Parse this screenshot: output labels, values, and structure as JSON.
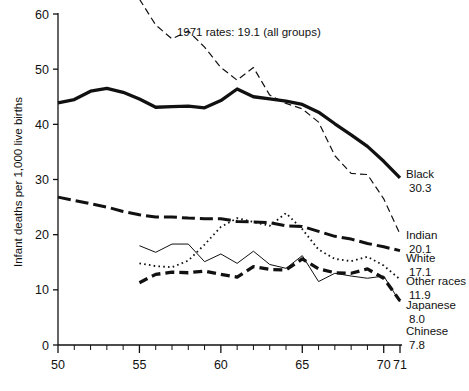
{
  "chart_data": {
    "type": "line",
    "title": "",
    "xlabel": "",
    "ylabel": "Infant deaths per 1,000 live births",
    "xlim": [
      50,
      71
    ],
    "ylim": [
      0,
      60
    ],
    "grid": false,
    "legend_position": "right-end-labels",
    "x_ticks_major": [
      "50",
      "55",
      "60",
      "65",
      "70",
      "71"
    ],
    "x_ticks_major_values": [
      50,
      55,
      60,
      65,
      70,
      71
    ],
    "x_ticks_minor_values": [
      51,
      52,
      53,
      54,
      56,
      57,
      58,
      59,
      61,
      62,
      63,
      64,
      66,
      67,
      68,
      69
    ],
    "y_ticks": [
      "0",
      "10",
      "20",
      "30",
      "40",
      "50",
      "60"
    ],
    "y_ticks_values": [
      0,
      10,
      20,
      30,
      40,
      50,
      60
    ],
    "annotations": [
      {
        "text": "1971 rates: 19.1 (all groups)",
        "x": 57.3,
        "y": 56.0
      }
    ],
    "series": [
      {
        "name": "Black",
        "style": "solid-thick",
        "end_label": "Black",
        "end_value": "30.3",
        "x": [
          50,
          51,
          52,
          53,
          54,
          55,
          56,
          57,
          58,
          59,
          60,
          61,
          62,
          63,
          64,
          65,
          66,
          67,
          68,
          69,
          70,
          71
        ],
        "values": [
          43.9,
          44.5,
          46.0,
          46.5,
          45.8,
          44.6,
          43.1,
          43.2,
          43.3,
          43.0,
          44.3,
          46.4,
          45.0,
          44.6,
          44.2,
          43.6,
          42.2,
          40.1,
          38.1,
          36.0,
          33.3,
          30.3
        ]
      },
      {
        "name": "Indian",
        "style": "dashed-thin",
        "end_label": "Indian",
        "end_value": "20.1",
        "x": [
          55,
          56,
          57,
          58,
          59,
          60,
          61,
          62,
          63,
          64,
          65,
          66,
          67,
          68,
          69,
          70,
          71
        ],
        "values": [
          62.7,
          58.0,
          55.5,
          56.9,
          54.0,
          50.3,
          48.0,
          50.3,
          45.3,
          43.8,
          42.8,
          40.4,
          34.3,
          31.1,
          30.9,
          26.5,
          20.1
        ]
      },
      {
        "name": "White",
        "style": "dash-dot-thick",
        "end_label": "White",
        "end_value": "17.1",
        "x": [
          50,
          51,
          52,
          53,
          54,
          55,
          56,
          57,
          58,
          59,
          60,
          61,
          62,
          63,
          64,
          65,
          66,
          67,
          68,
          69,
          70,
          71
        ],
        "values": [
          26.8,
          26.2,
          25.6,
          25.0,
          24.2,
          23.6,
          23.2,
          23.2,
          23.0,
          22.9,
          22.9,
          22.4,
          22.3,
          22.2,
          21.6,
          21.5,
          20.6,
          19.7,
          19.2,
          18.4,
          17.8,
          17.1
        ]
      },
      {
        "name": "Other races",
        "style": "dotted",
        "end_label": "Other races",
        "end_value": "11.9",
        "x": [
          55,
          56,
          57,
          58,
          59,
          60,
          61,
          62,
          63,
          64,
          65,
          66,
          67,
          68,
          69,
          70,
          71
        ],
        "values": [
          14.8,
          14.3,
          14.1,
          15.3,
          18.2,
          21.4,
          23.0,
          22.3,
          21.6,
          23.9,
          21.0,
          17.3,
          15.6,
          15.2,
          16.0,
          14.4,
          11.9
        ]
      },
      {
        "name": "Japanese",
        "style": "dashed-thick",
        "end_label": "Japanese",
        "end_value": "8.0",
        "x": [
          55,
          56,
          57,
          58,
          59,
          60,
          61,
          62,
          63,
          64,
          65,
          66,
          67,
          68,
          69,
          70,
          71
        ],
        "values": [
          11.3,
          12.8,
          13.2,
          13.1,
          13.4,
          12.8,
          12.3,
          14.2,
          13.7,
          13.6,
          15.6,
          13.8,
          13.1,
          13.0,
          13.8,
          12.1,
          8.0
        ]
      },
      {
        "name": "Chinese",
        "style": "solid-thin",
        "end_label": "Chinese",
        "end_value": "7.8",
        "x": [
          55,
          56,
          57,
          58,
          59,
          60,
          61,
          62,
          63,
          64,
          65,
          66,
          67,
          68,
          69,
          70,
          71
        ],
        "values": [
          18.0,
          16.8,
          18.3,
          18.3,
          15.1,
          16.5,
          14.8,
          17.0,
          14.6,
          13.9,
          16.2,
          11.5,
          13.0,
          12.5,
          12.1,
          12.5,
          7.8
        ]
      }
    ]
  }
}
